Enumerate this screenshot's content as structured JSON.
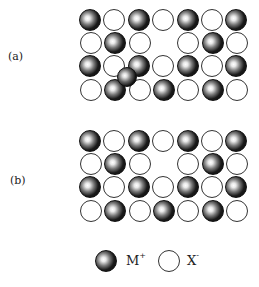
{
  "panels": [
    {
      "label": "(a)",
      "rows": [
        [
          "M",
          "X",
          "M",
          "X",
          "M",
          "X",
          "M"
        ],
        [
          "X",
          "M",
          "X",
          "gap",
          "X",
          "M",
          "X"
        ],
        [
          "M",
          "X",
          "M",
          "X",
          "M",
          "X",
          "M"
        ],
        [
          "X",
          "M",
          "X",
          "M",
          "X",
          "M",
          "X"
        ]
      ],
      "interstitial": {
        "type": "M",
        "between": "row 3 columns 2-3 and row 4"
      }
    },
    {
      "label": "(b)",
      "rows": [
        [
          "M",
          "X",
          "M",
          "X",
          "M",
          "X",
          "M"
        ],
        [
          "X",
          "M",
          "X",
          "gap",
          "X",
          "M",
          "X"
        ],
        [
          "M",
          "X",
          "M",
          "X",
          "M",
          "X",
          "M"
        ],
        [
          "X",
          "M",
          "X",
          "M",
          "X",
          "M",
          "X"
        ]
      ]
    }
  ],
  "legend": {
    "cation": {
      "symbol": "M",
      "charge": "+"
    },
    "anion": {
      "symbol": "X",
      "charge": "-"
    }
  },
  "caption": "",
  "colors": {
    "cation_fill": "#111111",
    "anion_fill": "#ffffff",
    "outline": "#333333"
  }
}
